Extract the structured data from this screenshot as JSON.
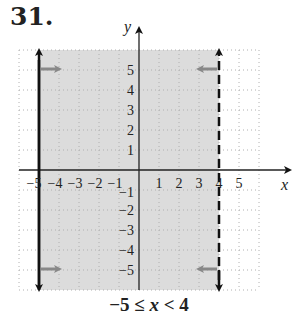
{
  "problem": {
    "number": "31."
  },
  "graph": {
    "x_axis_label": "x",
    "y_axis_label": "y",
    "x_ticks": [
      "−5",
      "−4",
      "−3",
      "−2",
      "−1",
      "1",
      "2",
      "3",
      "4",
      "5"
    ],
    "y_ticks_positive": [
      "5",
      "4",
      "3",
      "2",
      "1"
    ],
    "y_ticks_negative": [
      "−1",
      "−2",
      "−3",
      "−4",
      "−5"
    ],
    "shaded_region": {
      "x_min": -5,
      "x_max": 4,
      "color": "#dcdcdc"
    },
    "left_boundary": {
      "x": -5,
      "style": "solid",
      "inclusive": true
    },
    "right_boundary": {
      "x": 4,
      "style": "dashed",
      "inclusive": false
    },
    "grid_range": {
      "x": [
        -6,
        6
      ],
      "y": [
        -6,
        6
      ]
    },
    "colors": {
      "boundary": "#111111",
      "shade": "#dcdcdc",
      "grid": "#b0b0b0",
      "arrow_hint": "#888888"
    }
  },
  "caption": {
    "lhs": "−5 ≤ ",
    "var": "x",
    "rhs": " < 4"
  }
}
